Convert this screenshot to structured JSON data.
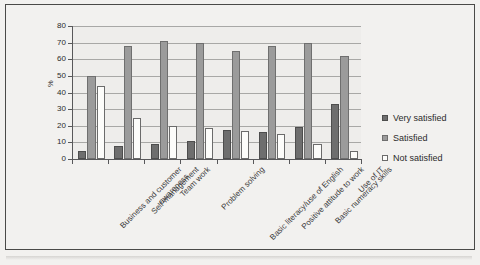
{
  "chart_data": {
    "type": "bar",
    "title": "",
    "subtitle": "",
    "xlabel": "",
    "ylabel": "%",
    "ylim": [
      0,
      80
    ],
    "ytick_labels": [
      "80",
      "70",
      "60",
      "50",
      "40",
      "30",
      "20",
      "10",
      "0"
    ],
    "yticks": [
      80,
      70,
      60,
      50,
      40,
      30,
      20,
      10,
      0
    ],
    "grid": true,
    "legend_position": "right",
    "categories": [
      "Business and customer awareness",
      "Self-management",
      "Team work",
      "Problem solving",
      "Basic literacy/use of English",
      "Positive attitude to work",
      "Basic numeracy skills",
      "Use of IT"
    ],
    "series": [
      {
        "name": "Very satisfied",
        "color": "#6e6e6e",
        "values": [
          5,
          8,
          9,
          11,
          17.5,
          16.5,
          19.5,
          33
        ]
      },
      {
        "name": "Satisfied",
        "color": "#9b9b9b",
        "values": [
          50,
          68,
          71,
          69.5,
          65,
          68,
          69.5,
          62
        ]
      },
      {
        "name": "Not satisfied",
        "color": "#fcfcfa",
        "values": [
          44,
          24.5,
          20,
          18.5,
          17,
          15,
          9,
          5
        ]
      }
    ]
  },
  "legend": {
    "items": [
      {
        "label": "Very satisfied",
        "swatch": "s0"
      },
      {
        "label": "Satisfied",
        "swatch": "s1"
      },
      {
        "label": "Not satisfied",
        "swatch": "s2"
      }
    ]
  },
  "axis": {
    "y_title": "%"
  }
}
